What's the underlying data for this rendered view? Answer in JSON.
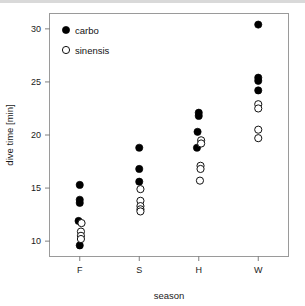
{
  "chart_data": {
    "type": "scatter",
    "title": "",
    "xlabel": "season",
    "ylabel": "dive time [min]",
    "categories": [
      "F",
      "S",
      "H",
      "W"
    ],
    "xtick_labels": [
      "F",
      "S",
      "H",
      "W"
    ],
    "ytick_labels": [
      "10",
      "15",
      "20",
      "25",
      "30"
    ],
    "ytick_values": [
      10,
      15,
      20,
      25,
      30
    ],
    "ylim": [
      8.6,
      31.4
    ],
    "grid": false,
    "legend_position": "top-left",
    "legend": [
      "carbo",
      "sinensis"
    ],
    "series": [
      {
        "name": "carbo",
        "marker": "filled-circle",
        "color": "#000000",
        "points": [
          {
            "season": "F",
            "x": 0,
            "y": 15.3,
            "jitter": 0.0
          },
          {
            "season": "F",
            "x": 0,
            "y": 13.9,
            "jitter": 0.0
          },
          {
            "season": "F",
            "x": 0,
            "y": 13.6,
            "jitter": 0.0
          },
          {
            "season": "F",
            "x": 0,
            "y": 11.9,
            "jitter": -0.02
          },
          {
            "season": "F",
            "x": 0,
            "y": 9.6,
            "jitter": 0.0
          },
          {
            "season": "S",
            "x": 1,
            "y": 18.8,
            "jitter": 0.0
          },
          {
            "season": "S",
            "x": 1,
            "y": 16.8,
            "jitter": 0.0
          },
          {
            "season": "S",
            "x": 1,
            "y": 15.6,
            "jitter": 0.0
          },
          {
            "season": "H",
            "x": 2,
            "y": 22.1,
            "jitter": 0.0
          },
          {
            "season": "H",
            "x": 2,
            "y": 21.8,
            "jitter": 0.0
          },
          {
            "season": "H",
            "x": 2,
            "y": 20.3,
            "jitter": -0.02
          },
          {
            "season": "H",
            "x": 2,
            "y": 18.8,
            "jitter": -0.03
          },
          {
            "season": "W",
            "x": 3,
            "y": 30.4,
            "jitter": 0.0
          },
          {
            "season": "W",
            "x": 3,
            "y": 25.4,
            "jitter": 0.0
          },
          {
            "season": "W",
            "x": 3,
            "y": 25.1,
            "jitter": 0.0
          },
          {
            "season": "W",
            "x": 3,
            "y": 24.2,
            "jitter": 0.0
          }
        ]
      },
      {
        "name": "sinensis",
        "marker": "open-circle",
        "color": "#ffffff",
        "points": [
          {
            "season": "F",
            "x": 0,
            "y": 11.7,
            "jitter": 0.03
          },
          {
            "season": "F",
            "x": 0,
            "y": 10.9,
            "jitter": 0.02
          },
          {
            "season": "F",
            "x": 0,
            "y": 10.5,
            "jitter": 0.02
          },
          {
            "season": "F",
            "x": 0,
            "y": 10.2,
            "jitter": 0.02
          },
          {
            "season": "S",
            "x": 1,
            "y": 14.9,
            "jitter": 0.02
          },
          {
            "season": "S",
            "x": 1,
            "y": 13.8,
            "jitter": 0.02
          },
          {
            "season": "S",
            "x": 1,
            "y": 13.3,
            "jitter": 0.02
          },
          {
            "season": "S",
            "x": 1,
            "y": 13.0,
            "jitter": 0.02
          },
          {
            "season": "S",
            "x": 1,
            "y": 12.8,
            "jitter": 0.02
          },
          {
            "season": "H",
            "x": 2,
            "y": 19.5,
            "jitter": 0.04
          },
          {
            "season": "H",
            "x": 2,
            "y": 19.2,
            "jitter": 0.04
          },
          {
            "season": "H",
            "x": 2,
            "y": 17.1,
            "jitter": 0.03
          },
          {
            "season": "H",
            "x": 2,
            "y": 16.8,
            "jitter": 0.03
          },
          {
            "season": "H",
            "x": 2,
            "y": 15.7,
            "jitter": 0.02
          },
          {
            "season": "W",
            "x": 3,
            "y": 22.9,
            "jitter": 0.0
          },
          {
            "season": "W",
            "x": 3,
            "y": 22.5,
            "jitter": 0.0
          },
          {
            "season": "W",
            "x": 3,
            "y": 20.5,
            "jitter": 0.0
          },
          {
            "season": "W",
            "x": 3,
            "y": 19.7,
            "jitter": 0.0
          }
        ]
      }
    ]
  }
}
